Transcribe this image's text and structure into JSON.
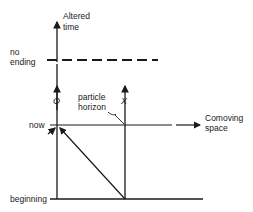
{
  "diagram": {
    "y_axis_label_line1": "Altered",
    "y_axis_label_line2": "time",
    "x_axis_label_line1": "Comoving",
    "x_axis_label_line2": "space",
    "levels": {
      "no_ending_line1": "no",
      "no_ending_line2": "ending",
      "now": "now",
      "beginning": "beginning"
    },
    "observers": {
      "o": "O",
      "x": "X"
    },
    "annotation_line1": "particle",
    "annotation_line2": "horizon",
    "colors": {
      "ink": "#1a1a1a",
      "background": "#ffffff"
    }
  }
}
